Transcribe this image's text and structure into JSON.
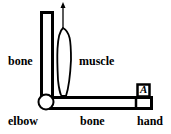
{
  "diagram": {
    "labels": {
      "upper_bone": "bone",
      "muscle": "muscle",
      "elbow": "elbow",
      "lower_bone": "bone",
      "hand": "hand",
      "load": "A"
    },
    "colors": {
      "stroke": "#000000",
      "fill": "#ffffff"
    }
  }
}
